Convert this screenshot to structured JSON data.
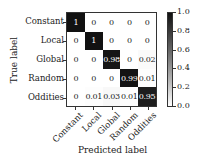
{
  "chart_data": {
    "type": "heatmap",
    "title": "",
    "xlabel": "Predicted label",
    "ylabel": "True label",
    "x_categories": [
      "Constant",
      "Local",
      "Global",
      "Random",
      "Oddities"
    ],
    "y_categories": [
      "Constant",
      "Local",
      "Global",
      "Random",
      "Oddities"
    ],
    "values": [
      [
        1,
        0,
        0,
        0,
        0
      ],
      [
        0,
        1,
        0,
        0,
        0
      ],
      [
        0,
        0,
        0.98,
        0,
        0.02
      ],
      [
        0,
        0,
        0,
        0.99,
        0.01
      ],
      [
        0,
        0.01,
        0.03,
        0.01,
        0.95
      ]
    ],
    "value_labels": [
      [
        "1",
        "0",
        "0",
        "0",
        "0"
      ],
      [
        "0",
        "1",
        "0",
        "0",
        "0"
      ],
      [
        "0",
        "0",
        "0.98",
        "0",
        "0.02"
      ],
      [
        "0",
        "0",
        "0",
        "0.99",
        "0.01"
      ],
      [
        "0",
        "0.01",
        "0.03",
        "0.01",
        "0.95"
      ]
    ],
    "colorbar": {
      "range": [
        0.0,
        1.0
      ],
      "ticks": [
        "0.0",
        "0.2",
        "0.4",
        "0.6",
        "0.8",
        "1.0"
      ],
      "colormap": "Greys"
    },
    "grid": false,
    "legend": "colorbar-right"
  },
  "colors": {
    "high": "#111111",
    "low": "#ffffff",
    "text_dark": "#222222",
    "text_light": "#ffffff"
  }
}
